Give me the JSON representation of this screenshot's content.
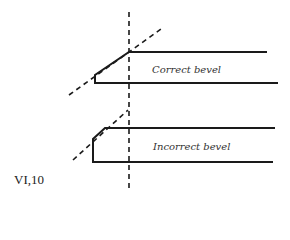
{
  "figure": {
    "number_label": "VI,10",
    "colors": {
      "line": "#1a1a1a",
      "text": "#333333",
      "background": "#ffffff"
    }
  },
  "diagram": {
    "correct": {
      "label": "Correct bevel"
    },
    "incorrect": {
      "label": "Incorrect bevel"
    }
  }
}
